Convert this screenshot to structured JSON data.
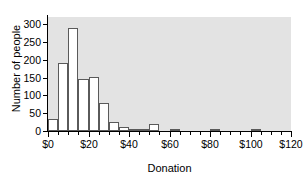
{
  "chart_data": {
    "type": "bar",
    "title": "",
    "subtitle": "",
    "xlabel": "Donation",
    "ylabel": "Number of people",
    "xlim": [
      0,
      120
    ],
    "ylim": [
      0,
      320
    ],
    "bin_width": 5,
    "grid": false,
    "legend": null,
    "plot_background": "#e3e3e3",
    "bar_fill": "#ffffff",
    "bar_edge": "#5a5a5a",
    "x_tick_labels": [
      "$0",
      "$20",
      "$40",
      "$60",
      "$80",
      "$100",
      "$120"
    ],
    "x_tick_values": [
      0,
      20,
      40,
      60,
      80,
      100,
      120
    ],
    "x_minor_tick_values": [
      5,
      10,
      15,
      25,
      30,
      35,
      45,
      50,
      55,
      65,
      70,
      75,
      85,
      90,
      95,
      105,
      110,
      115
    ],
    "y_tick_labels": [
      "0",
      "50",
      "100",
      "150",
      "200",
      "250",
      "300"
    ],
    "y_tick_values": [
      0,
      50,
      100,
      150,
      200,
      250,
      300
    ],
    "categories": [
      "0-5",
      "5-10",
      "10-15",
      "15-20",
      "20-25",
      "25-30",
      "30-35",
      "35-40",
      "40-45",
      "45-50",
      "50-55",
      "55-60",
      "60-65",
      "65-70",
      "70-75",
      "75-80",
      "80-85",
      "85-90",
      "90-95",
      "95-100",
      "100-105",
      "105-110",
      "110-115",
      "115-120"
    ],
    "bin_starts": [
      0,
      5,
      10,
      15,
      20,
      25,
      30,
      35,
      40,
      45,
      50,
      55,
      60,
      65,
      70,
      75,
      80,
      85,
      90,
      95,
      100,
      105,
      110,
      115
    ],
    "values": [
      33,
      192,
      290,
      147,
      153,
      78,
      26,
      12,
      7,
      3,
      19,
      0,
      2,
      0,
      0,
      0,
      2,
      0,
      0,
      0,
      6,
      0,
      0,
      0
    ]
  }
}
